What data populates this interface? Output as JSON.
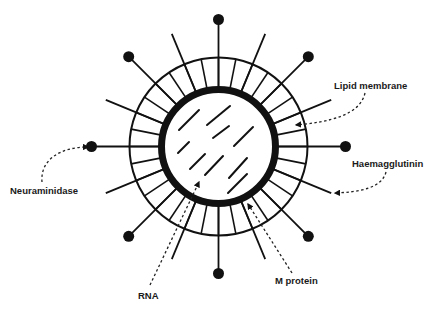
{
  "diagram": {
    "colors": {
      "stroke": "#111111",
      "background": "#ffffff"
    },
    "geometry": {
      "center": [
        218.5,
        146.5
      ],
      "outer_ring_radius": 89,
      "inner_ring_radius": 57,
      "inner_ring_stroke": 7,
      "knob_spike_radius": 127,
      "plain_spike_radius": 122,
      "knob_radius": 5.5,
      "ring_tick_count": 32
    },
    "labels": [
      {
        "id": "lipid-membrane",
        "text": "Lipid membrane",
        "x": 334,
        "y": 81
      },
      {
        "id": "haemagglutinin",
        "text": "Haemagglutinin",
        "x": 352,
        "y": 159
      },
      {
        "id": "neuraminidase",
        "text": "Neuraminidase",
        "x": 10,
        "y": 186
      },
      {
        "id": "m-protein",
        "text": "M protein",
        "x": 275,
        "y": 276
      },
      {
        "id": "rna",
        "text": "RNA",
        "x": 138,
        "y": 291
      }
    ],
    "rna_strands": [
      [
        179,
        130,
        199,
        110
      ],
      [
        207,
        125,
        230,
        106
      ],
      [
        213,
        138,
        229,
        126
      ],
      [
        234,
        146,
        253,
        127
      ],
      [
        178,
        153,
        189,
        142
      ],
      [
        190,
        169,
        205,
        154
      ],
      [
        205,
        175,
        223,
        156
      ],
      [
        229,
        178,
        247,
        158
      ],
      [
        228,
        193,
        247,
        174
      ]
    ],
    "pointers": [
      {
        "id": "lipid-membrane-pointer",
        "path": "M365,93 C360,115 330,122 296,125",
        "arrow": [
          295,
          125
        ]
      },
      {
        "id": "haemagglutinin-pointer",
        "path": "M386,172 C382,188 360,192 335,193",
        "arrow": [
          333,
          193
        ]
      },
      {
        "id": "neuraminidase-pointer",
        "path": "M42,182 C40,160 60,147 88,147",
        "arrow": [
          90,
          147
        ]
      },
      {
        "id": "m-protein-pointer",
        "path": "M292,273 L248,204",
        "arrow": [
          247,
          203
        ]
      },
      {
        "id": "rna-pointer",
        "path": "M150,285 L199,182",
        "arrow": [
          200,
          180
        ]
      }
    ]
  }
}
